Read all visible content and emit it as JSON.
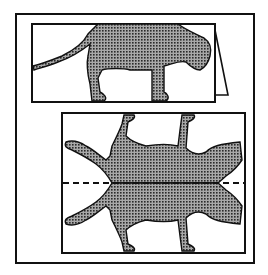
{
  "figure": {
    "colors": {
      "line": "#111111",
      "fill_base": "#9a9a9a",
      "fill_dot": "#2a2a2a",
      "background": "#ffffff"
    },
    "panels": [
      {
        "id": "folded-card",
        "label": ""
      },
      {
        "id": "unfolded-pattern",
        "label": ""
      }
    ],
    "fold_line": {
      "style": "dashed"
    }
  }
}
